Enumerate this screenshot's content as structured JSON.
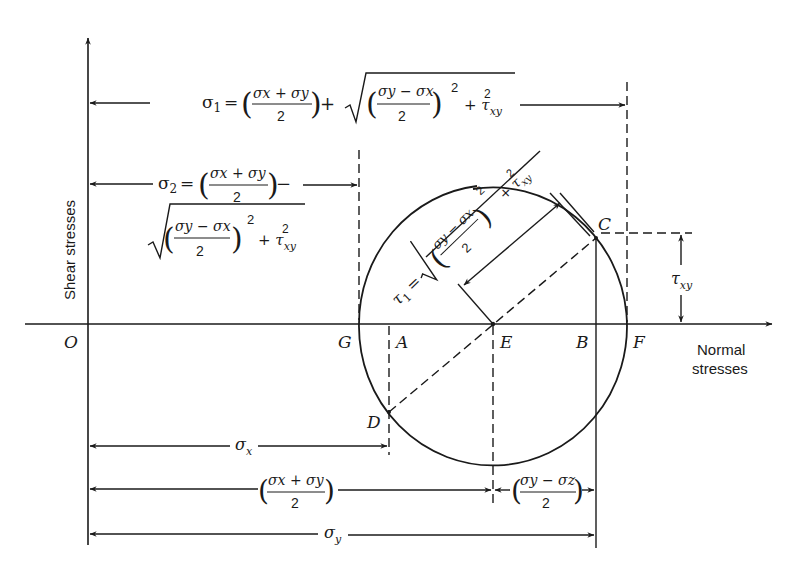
{
  "diagram": {
    "ink_color": "#1a1a1a",
    "background": "#ffffff",
    "axes": {
      "vertical_label": "Shear stresses",
      "horizontal_label_line1": "Normal",
      "horizontal_label_line2": "stresses",
      "origin_label": "O"
    },
    "points": {
      "G": "G",
      "A": "A",
      "E": "E",
      "B": "B",
      "F": "F",
      "C": "C",
      "D": "D"
    },
    "formulas": {
      "sigma1": {
        "lhs": "σ",
        "lhs_sub": "1",
        "eq": "=",
        "frac_num": "σx + σy",
        "frac_den": "2",
        "op": "+",
        "sqrt_num": "σy − σx",
        "sqrt_den": "2",
        "power": "2",
        "plus_tau": "+ τ",
        "tau_sub": "xy",
        "tau_sup": "2"
      },
      "sigma2": {
        "lhs": "σ",
        "lhs_sub": "2",
        "eq": "=",
        "frac_num": "σx + σy",
        "frac_den": "2",
        "op": "−",
        "sqrt_num": "σy − σx",
        "sqrt_den": "2",
        "power": "2",
        "plus_tau": "+ τ",
        "tau_sub": "xy",
        "tau_sup": "2"
      },
      "tau1": {
        "lhs": "τ",
        "lhs_sub": "1",
        "eq": "=",
        "sqrt_num": "σy − σx",
        "sqrt_den": "2",
        "power": "2",
        "plus_tau": "+ τ",
        "tau_sub": "xy",
        "tau_sup": "2"
      }
    },
    "dimensions": {
      "tau_xy": {
        "symbol": "τ",
        "sub": "xy"
      },
      "sigma_x": {
        "symbol": "σ",
        "sub": "x"
      },
      "mean": {
        "num": "σx + σy",
        "den": "2"
      },
      "half_diff": {
        "num": "σy − σz",
        "den": "2"
      },
      "sigma_y": {
        "symbol": "σ",
        "sub": "y"
      }
    }
  }
}
